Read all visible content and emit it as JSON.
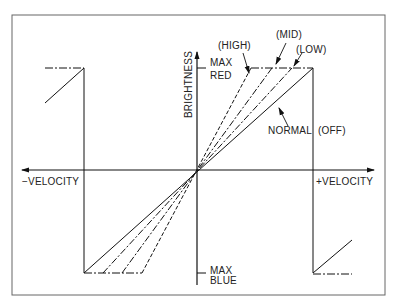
{
  "diagram": {
    "type": "transfer-function",
    "axes": {
      "x_negative_label": "−VELOCITY",
      "x_positive_label": "+VELOCITY",
      "y_label": "BRIGHTNESS",
      "y_max_label_line1": "MAX",
      "y_max_label_line2": "RED",
      "y_min_label_line1": "MAX",
      "y_min_label_line2": "BLUE"
    },
    "curves": [
      {
        "name": "HIGH",
        "label": "(HIGH)",
        "style": "dashed"
      },
      {
        "name": "MID",
        "label": "(MID)",
        "style": "dash-dot"
      },
      {
        "name": "LOW",
        "label": "(LOW)",
        "style": "dash-dot"
      },
      {
        "name": "NORMAL",
        "label": "NORMAL",
        "style": "solid",
        "note": "(OFF)"
      }
    ],
    "colors": {
      "line": "#222222",
      "frame": "#555555",
      "background": "#ffffff"
    }
  }
}
